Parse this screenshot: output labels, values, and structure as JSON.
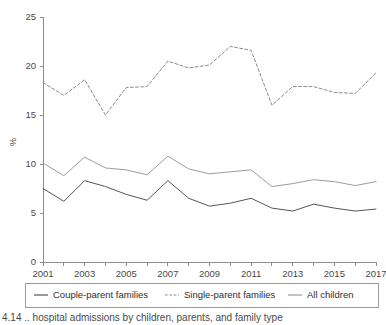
{
  "figure": {
    "caption": "4.14 .. hospital admissions by children, parents, and family type",
    "caption_clipped": true
  },
  "chart_data": {
    "type": "line",
    "title": "",
    "xlabel": "",
    "ylabel": "%",
    "x": [
      2001,
      2002,
      2003,
      2004,
      2005,
      2006,
      2007,
      2008,
      2009,
      2010,
      2011,
      2012,
      2013,
      2014,
      2015,
      2016,
      2017
    ],
    "xlim": [
      2001,
      2017
    ],
    "ylim": [
      0,
      25
    ],
    "yticks": [
      0,
      5,
      10,
      15,
      20,
      25
    ],
    "ytick_labels": [
      "0",
      "5",
      "10",
      "15",
      "20",
      "25"
    ],
    "xticks": [
      2001,
      2002,
      2003,
      2004,
      2005,
      2006,
      2007,
      2008,
      2009,
      2010,
      2011,
      2012,
      2013,
      2014,
      2015,
      2016,
      2017
    ],
    "xtick_labels_shown": [
      "2001",
      "2003",
      "2005",
      "2007",
      "2009",
      "2011",
      "2013",
      "2015",
      "2017"
    ],
    "grid": false,
    "legend_position": "bottom",
    "series": [
      {
        "name": "Couple-parent families",
        "style": "solid",
        "color": "#555555",
        "values": [
          7.5,
          6.2,
          8.3,
          7.7,
          6.9,
          6.3,
          8.3,
          6.5,
          5.7,
          6.0,
          6.5,
          5.5,
          5.2,
          5.9,
          5.5,
          5.2,
          5.4
        ]
      },
      {
        "name": "Single-parent families",
        "style": "dashed",
        "color": "#8a8a8a",
        "values": [
          18.3,
          17.0,
          18.6,
          15.0,
          17.8,
          17.9,
          20.5,
          19.8,
          20.1,
          22.0,
          21.6,
          16.0,
          17.9,
          17.9,
          17.3,
          17.2,
          19.3
        ]
      },
      {
        "name": "All children",
        "style": "solid",
        "color": "#9c9c9c",
        "values": [
          10.1,
          8.8,
          10.7,
          9.6,
          9.4,
          8.9,
          10.8,
          9.5,
          9.0,
          9.2,
          9.4,
          7.7,
          8.0,
          8.4,
          8.2,
          7.8,
          8.2
        ]
      }
    ]
  },
  "legend": {
    "items": [
      {
        "label": "Couple-parent families",
        "style": "solid",
        "color": "#555555"
      },
      {
        "label": "Single-parent families",
        "style": "dashed",
        "color": "#8a8a8a"
      },
      {
        "label": "All children",
        "style": "solid",
        "color": "#9c9c9c"
      }
    ]
  }
}
